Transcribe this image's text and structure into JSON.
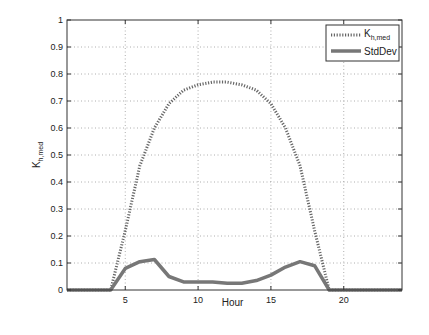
{
  "chart_data": {
    "type": "line",
    "title": "",
    "xlabel": "Hour",
    "ylabel": "K_h,med",
    "xlim": [
      1,
      24
    ],
    "ylim": [
      0,
      1
    ],
    "xticks": [
      5,
      10,
      15,
      20
    ],
    "yticks": [
      0,
      0.1,
      0.2,
      0.3,
      0.4,
      0.5,
      0.6,
      0.7,
      0.8,
      0.9,
      1
    ],
    "ytick_labels": [
      "0",
      "0.1",
      "0.2",
      "0.3",
      "0.4",
      "0.5",
      "0.6",
      "0.7",
      "0.8",
      "0.9",
      "1"
    ],
    "grid": true,
    "legend_position": "upper right",
    "x": [
      1,
      2,
      3,
      4,
      5,
      6,
      7,
      8,
      9,
      10,
      11,
      12,
      13,
      14,
      15,
      16,
      17,
      18,
      19,
      20,
      21,
      22,
      23,
      24
    ],
    "series": [
      {
        "name": "K_h,med",
        "style": "dotted",
        "color": "#666666",
        "values": [
          0,
          0,
          0,
          0,
          0.22,
          0.46,
          0.6,
          0.69,
          0.74,
          0.76,
          0.77,
          0.77,
          0.76,
          0.74,
          0.69,
          0.6,
          0.46,
          0.22,
          0,
          0,
          0,
          0,
          0,
          0
        ]
      },
      {
        "name": "StdDev",
        "style": "solid",
        "color": "#777777",
        "values": [
          0,
          0,
          0,
          0,
          0.08,
          0.105,
          0.113,
          0.05,
          0.03,
          0.03,
          0.03,
          0.025,
          0.025,
          0.035,
          0.055,
          0.085,
          0.105,
          0.09,
          0,
          0,
          0,
          0,
          0,
          0
        ]
      }
    ]
  },
  "legend": {
    "entry1_main": "K",
    "entry1_sub": "h,med",
    "entry2": "StdDev"
  },
  "axes": {
    "xlabel": "Hour",
    "ylabel_main": "K",
    "ylabel_sub": "h,med"
  }
}
